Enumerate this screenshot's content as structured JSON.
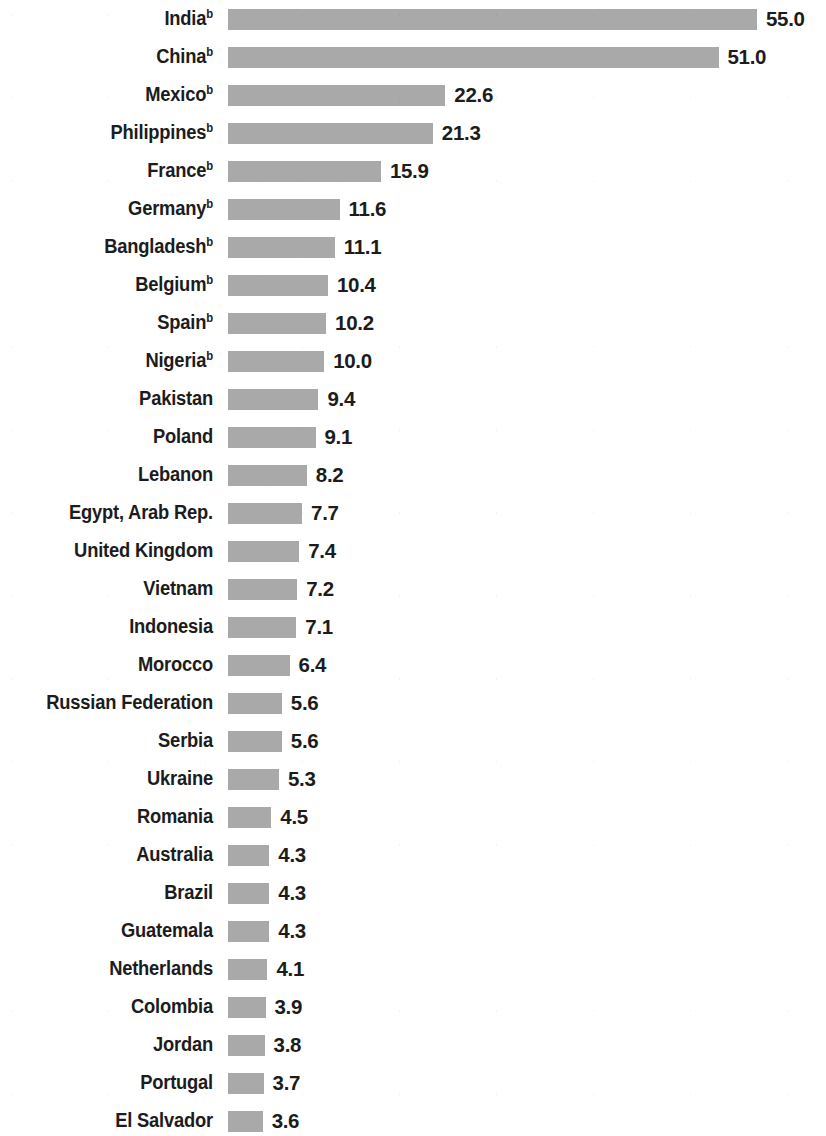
{
  "chart_data": {
    "type": "bar",
    "orientation": "horizontal",
    "title": "",
    "subtitle": "",
    "xlabel": "",
    "ylabel": "",
    "grid": false,
    "legend": null,
    "xlim": [
      0,
      55.0
    ],
    "bar_color": "#a9a9a9",
    "text_color": "#1c1c1c",
    "background_color": "#ffffff",
    "value_format": "one-decimal",
    "footnote_marker": "b",
    "categories": [
      "India",
      "China",
      "Mexico",
      "Philippines",
      "France",
      "Germany",
      "Bangladesh",
      "Belgium",
      "Spain",
      "Nigeria",
      "Pakistan",
      "Poland",
      "Lebanon",
      "Egypt, Arab Rep.",
      "United Kingdom",
      "Vietnam",
      "Indonesia",
      "Morocco",
      "Russian Federation",
      "Serbia",
      "Ukraine",
      "Romania",
      "Australia",
      "Brazil",
      "Guatemala",
      "Netherlands",
      "Colombia",
      "Jordan",
      "Portugal",
      "El Salvador"
    ],
    "values": [
      55.0,
      51.0,
      22.6,
      21.3,
      15.9,
      11.6,
      11.1,
      10.4,
      10.2,
      10.0,
      9.4,
      9.1,
      8.2,
      7.7,
      7.4,
      7.2,
      7.1,
      6.4,
      5.6,
      5.6,
      5.3,
      4.5,
      4.3,
      4.3,
      4.3,
      4.1,
      3.9,
      3.8,
      3.7,
      3.6
    ],
    "value_labels": [
      "55.0",
      "51.0",
      "22.6",
      "21.3",
      "15.9",
      "11.6",
      "11.1",
      "10.4",
      "10.2",
      "10.0",
      "9.4",
      "9.1",
      "8.2",
      "7.7",
      "7.4",
      "7.2",
      "7.1",
      "6.4",
      "5.6",
      "5.6",
      "5.3",
      "4.5",
      "4.3",
      "4.3",
      "4.3",
      "4.1",
      "3.9",
      "3.8",
      "3.7",
      "3.6"
    ],
    "footnote_flags": [
      true,
      true,
      true,
      true,
      true,
      true,
      true,
      true,
      true,
      true,
      false,
      false,
      false,
      false,
      false,
      false,
      false,
      false,
      false,
      false,
      false,
      false,
      false,
      false,
      false,
      false,
      false,
      false,
      false,
      false
    ]
  }
}
